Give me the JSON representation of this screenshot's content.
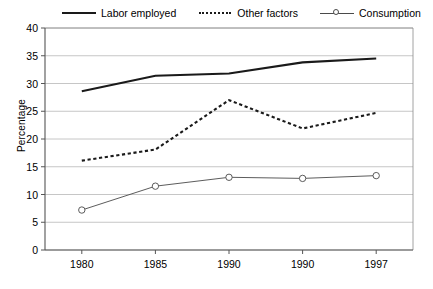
{
  "chart_data": {
    "type": "line",
    "title": "",
    "xlabel": "",
    "ylabel": "Percentage",
    "categories": [
      "1980",
      "1985",
      "1990",
      "1990",
      "1997"
    ],
    "ylim": [
      0,
      40
    ],
    "ytick_step": 5,
    "yticks": [
      "40",
      "35",
      "30",
      "25",
      "20",
      "15",
      "10",
      "5",
      "0"
    ],
    "grid": true,
    "legend_position": "top",
    "series": [
      {
        "name": "Labor employed",
        "style": "solid",
        "marker": "none",
        "color": "#1a1a1a",
        "values": [
          28.6,
          31.4,
          31.8,
          33.8,
          34.5
        ]
      },
      {
        "name": "Other factors",
        "style": "dotted",
        "marker": "none",
        "color": "#1a1a1a",
        "values": [
          16.1,
          18.1,
          27.0,
          21.9,
          24.7
        ]
      },
      {
        "name": "Consumption",
        "style": "solid-thin",
        "marker": "circle",
        "color": "#4a4a4a",
        "values": [
          7.2,
          11.5,
          13.1,
          12.9,
          13.4
        ]
      }
    ]
  },
  "legend": {
    "items": [
      {
        "label": "Labor employed"
      },
      {
        "label": "Other factors"
      },
      {
        "label": "Consumption"
      }
    ]
  }
}
